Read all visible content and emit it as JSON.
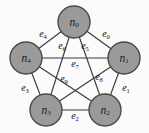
{
  "figure": {
    "type": "graph-diagram",
    "width": 149,
    "height": 133,
    "background_color": "#fbfbfb",
    "node_fill_color": "#9a9a9a",
    "node_stroke_color": "#4a4a4a",
    "edge_color": "#3b3b3b",
    "label_color": "#111111"
  },
  "nodes": [
    {
      "id": "n0",
      "base": "n",
      "sub": "0",
      "cx": 74,
      "cy": 22,
      "r": 16
    },
    {
      "id": "n1",
      "base": "n",
      "sub": "1",
      "cx": 124,
      "cy": 58,
      "r": 16
    },
    {
      "id": "n2",
      "base": "n",
      "sub": "2",
      "cx": 105,
      "cy": 110,
      "r": 16
    },
    {
      "id": "n3",
      "base": "n",
      "sub": "3",
      "cx": 46,
      "cy": 110,
      "r": 16
    },
    {
      "id": "n4",
      "base": "n",
      "sub": "4",
      "cx": 26,
      "cy": 58,
      "r": 16
    }
  ],
  "edges": [
    {
      "id": "e0",
      "base": "e",
      "sub": "0",
      "from": "n0",
      "to": "n1",
      "kind": "outer",
      "lx": 106,
      "ly": 33
    },
    {
      "id": "e1",
      "base": "e",
      "sub": "1",
      "from": "n1",
      "to": "n2",
      "kind": "outer",
      "lx": 126,
      "ly": 87
    },
    {
      "id": "e2",
      "base": "e",
      "sub": "2",
      "from": "n2",
      "to": "n3",
      "kind": "outer",
      "lx": 75,
      "ly": 115
    },
    {
      "id": "e3",
      "base": "e",
      "sub": "3",
      "from": "n3",
      "to": "n4",
      "kind": "outer",
      "lx": 25,
      "ly": 87
    },
    {
      "id": "e4",
      "base": "e",
      "sub": "4",
      "from": "n4",
      "to": "n0",
      "kind": "outer",
      "lx": 43,
      "ly": 33
    },
    {
      "id": "e5",
      "base": "e",
      "sub": "5",
      "from": "n0",
      "to": "n2",
      "kind": "inner",
      "lx": 85,
      "ly": 45
    },
    {
      "id": "e6",
      "base": "e",
      "sub": "6",
      "from": "n0",
      "to": "n3",
      "kind": "inner",
      "lx": 62,
      "ly": 45
    },
    {
      "id": "e7",
      "base": "e",
      "sub": "7",
      "from": "n4",
      "to": "n1",
      "kind": "inner",
      "lx": 75,
      "ly": 63
    },
    {
      "id": "e8",
      "base": "e",
      "sub": "8",
      "from": "n1",
      "to": "n3",
      "kind": "inner",
      "lx": 99,
      "ly": 76
    },
    {
      "id": "e9",
      "base": "e",
      "sub": "9",
      "from": "n4",
      "to": "n2",
      "kind": "inner",
      "lx": 64,
      "ly": 78
    }
  ]
}
